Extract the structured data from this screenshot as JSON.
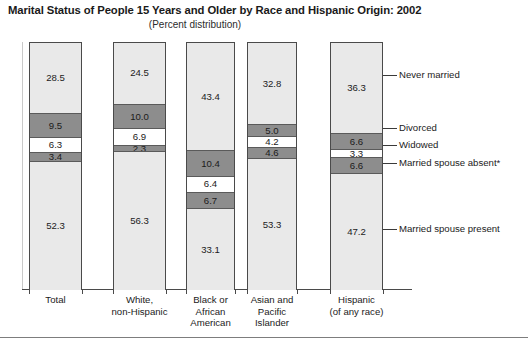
{
  "title": "Marital Status of People 15 Years and Older by Race and Hispanic Origin: 2002",
  "subtitle": "(Percent distribution)",
  "colors": {
    "light_gray": "#e9e9e9",
    "dark_gray": "#8d8d8d",
    "white": "#ffffff",
    "outline": "#4a4a4a",
    "text": "#1b1b1b"
  },
  "callouts": [
    {
      "label": "Never married"
    },
    {
      "label": "Divorced"
    },
    {
      "label": "Widowed"
    },
    {
      "label": "Married spouse absent*"
    },
    {
      "label": "Married spouse present"
    }
  ],
  "chart_data": {
    "type": "bar",
    "title": "Marital Status of People 15 Years and Older by Race and Hispanic Origin: 2002",
    "subtitle": "(Percent distribution)",
    "xlabel": "",
    "ylabel": "Percent distribution",
    "ylim": [
      0,
      100
    ],
    "grid": false,
    "stacked": true,
    "legend_position": "right-callouts",
    "categories": [
      "Total",
      "White, non-Hispanic",
      "Black or African American",
      "Asian and Pacific Islander",
      "Hispanic (of any race)"
    ],
    "category_lines": [
      [
        "Total"
      ],
      [
        "White,",
        "non-Hispanic"
      ],
      [
        "Black or",
        "African",
        "American"
      ],
      [
        "Asian and",
        "Pacific",
        "Islander"
      ],
      [
        "Hispanic",
        "(of any race)"
      ]
    ],
    "series": [
      {
        "name": "Never married",
        "fill": "light",
        "values": [
          28.5,
          24.5,
          43.4,
          32.8,
          36.3
        ]
      },
      {
        "name": "Divorced",
        "fill": "dark",
        "values": [
          9.5,
          10.0,
          10.4,
          5.0,
          6.6
        ]
      },
      {
        "name": "Widowed",
        "fill": "white",
        "values": [
          6.3,
          6.9,
          6.4,
          4.2,
          3.3
        ]
      },
      {
        "name": "Married spouse absent*",
        "fill": "dark",
        "values": [
          3.4,
          2.3,
          6.7,
          4.6,
          6.6
        ]
      },
      {
        "name": "Married spouse present",
        "fill": "light",
        "values": [
          52.3,
          56.3,
          33.1,
          53.3,
          47.2
        ]
      }
    ],
    "footnote": "* Married spouse absent"
  },
  "layout": {
    "bar_geometry": [
      {
        "x": 29,
        "w": 53
      },
      {
        "x": 113,
        "w": 53
      },
      {
        "x": 186,
        "w": 49
      },
      {
        "x": 247,
        "w": 50
      },
      {
        "x": 330,
        "w": 53
      }
    ],
    "plot_top": 42,
    "plot_bottom": 289,
    "callout_y": [
      75,
      128,
      145,
      163,
      229
    ]
  }
}
